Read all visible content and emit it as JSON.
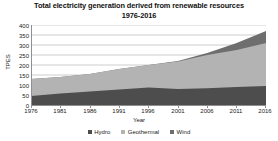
{
  "chart_data": {
    "type": "area",
    "stacked": true,
    "title": "Total electricity generation derived from renewable resources",
    "subtitle": "1976-2016",
    "xlabel": "Year",
    "ylabel": "TPES",
    "xlim": [
      1976,
      2016
    ],
    "ylim": [
      0,
      400
    ],
    "ytick_step": 50,
    "grid": true,
    "grid_axis": "y",
    "legend_position": "bottom",
    "x": [
      1976,
      1981,
      1986,
      1991,
      1996,
      2001,
      2006,
      2011,
      2016
    ],
    "xticks": [
      "1976",
      "1981",
      "1986",
      "1991",
      "1996",
      "2001",
      "2006",
      "2011",
      "2016"
    ],
    "yticks": [
      "0",
      "50",
      "100",
      "150",
      "200",
      "250",
      "300",
      "350",
      "400"
    ],
    "series": [
      {
        "name": "Hydro",
        "color": "#4d4d4d",
        "values": [
          45,
          58,
          68,
          78,
          88,
          80,
          84,
          90,
          95
        ]
      },
      {
        "name": "Geothermal",
        "color": "#b3b3b3",
        "values": [
          85,
          82,
          87,
          102,
          112,
          137,
          166,
          185,
          215
        ]
      },
      {
        "name": "Wind",
        "color": "#6e6e6e",
        "values": [
          0,
          0,
          0,
          0,
          0,
          3,
          10,
          35,
          60
        ]
      }
    ],
    "totals": [
      130,
      140,
      155,
      180,
      200,
      220,
      260,
      310,
      370
    ]
  },
  "legend": {
    "items": [
      {
        "label": "Hydro",
        "color": "#4d4d4d"
      },
      {
        "label": "Geothermal",
        "color": "#b3b3b3"
      },
      {
        "label": "Wind",
        "color": "#6e6e6e"
      }
    ]
  },
  "colors": {
    "axis": "#8f8f8f",
    "grid": "#9a9a9a",
    "text": "#222222",
    "background": "#ffffff"
  }
}
